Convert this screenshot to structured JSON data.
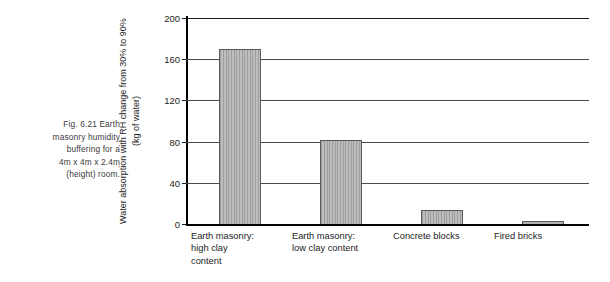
{
  "caption": {
    "name": "figure-caption",
    "lines": [
      "Fig. 6.21 Earth",
      "masonry humidity",
      "buffering for a",
      "4m x 4m x 2.4m",
      "(height) room."
    ]
  },
  "chart_data": {
    "type": "bar",
    "title": "",
    "subtitle": "",
    "xlabel": "",
    "ylabel": "Water absorption with RH change from 30% to 90% (kg of water)",
    "categories": [
      "Earth masonry: high clay content",
      "Earth masonry: low clay content",
      "Concrete blocks",
      "Fired bricks"
    ],
    "category_lines": [
      [
        "Earth masonry:",
        "high clay",
        "content"
      ],
      [
        "Earth masonry:",
        "low clay content"
      ],
      [
        "Concrete blocks"
      ],
      [
        "Fired bricks"
      ]
    ],
    "values": [
      170,
      82,
      14,
      3
    ],
    "ylim": [
      0,
      200
    ],
    "yticks": [
      0,
      40,
      80,
      120,
      160,
      200
    ],
    "ytick_labels": [
      "0",
      "40",
      "80",
      "120",
      "160",
      "200"
    ],
    "grid": true,
    "grid_axis": "y",
    "legend": false,
    "legend_position": "none",
    "bar_color": "#acacac",
    "bar_edge_color": "#5a5a5a",
    "axis_color": "#000000",
    "grid_color": "#4a4a4a",
    "text_color": "#1c1c1c"
  }
}
